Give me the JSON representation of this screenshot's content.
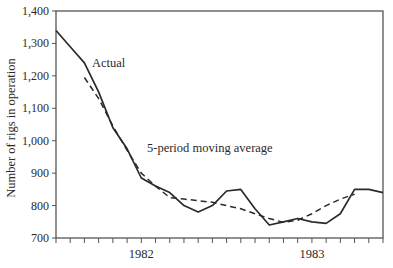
{
  "chart_data": {
    "type": "line",
    "title": "",
    "xlabel": "",
    "ylabel": "Number of rigs in operation",
    "ylim": [
      700,
      1400
    ],
    "yticks": [
      700,
      800,
      900,
      1000,
      1100,
      1200,
      1300,
      1400
    ],
    "ytick_labels": [
      "700",
      "800",
      "900",
      "1,000",
      "1,100",
      "1,200",
      "1,300",
      "1,400"
    ],
    "x_periods": 24,
    "x_tick_interval": "month",
    "x_year_labels": [
      {
        "label": "1982",
        "center_index": 6
      },
      {
        "label": "1983",
        "center_index": 18
      }
    ],
    "grid": false,
    "series": [
      {
        "name": "Actual",
        "style": "solid",
        "start_index": 0,
        "values": [
          1340,
          1290,
          1240,
          1150,
          1040,
          975,
          885,
          860,
          840,
          800,
          780,
          800,
          845,
          850,
          790,
          740,
          750,
          760,
          750,
          745,
          775,
          850,
          850,
          840
        ]
      },
      {
        "name": "5-period moving average",
        "style": "dashed",
        "start_index": 2,
        "values": [
          1195,
          1130,
          1045,
          970,
          900,
          860,
          825,
          820,
          815,
          810,
          800,
          790,
          775,
          760,
          748,
          755,
          775,
          800,
          820,
          835
        ]
      }
    ],
    "annotations": [
      {
        "text": "Actual",
        "series": "Actual"
      },
      {
        "text": "5-period moving average",
        "series": "5-period moving average"
      }
    ],
    "legend": "inline annotations"
  },
  "colors": {
    "line": "#2a2a2a",
    "axis": "#555555",
    "background": "#ffffff"
  }
}
